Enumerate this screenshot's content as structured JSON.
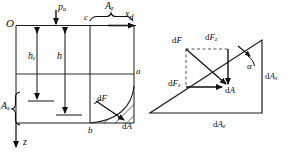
{
  "figure": {
    "type": "engineering-diagram",
    "panels": [
      "left-elevation-view",
      "right-force-decomposition"
    ]
  },
  "left_panel": {
    "axes": {
      "origin_label": "O",
      "x_axis_label": "x",
      "z_axis_label": "z"
    },
    "surface_pressure": {
      "symbol": "p",
      "subscript": "a"
    },
    "depths": [
      {
        "symbol": "h",
        "subscript": "c"
      },
      {
        "symbol": "h",
        "subscript": ""
      }
    ],
    "areas": [
      {
        "symbol": "A",
        "subscript": "z"
      },
      {
        "symbol": "A",
        "subscript": "x"
      }
    ],
    "points": [
      "c",
      "d",
      "a",
      "b"
    ],
    "force_element": {
      "symbol": "dF",
      "subscript": ""
    },
    "area_element": {
      "symbol": "dA",
      "subscript": ""
    }
  },
  "right_panel": {
    "resultant": {
      "symbol": "dF",
      "subscript": ""
    },
    "vertical_component": {
      "symbol": "dF",
      "subscript": "z"
    },
    "horizontal_component": {
      "symbol": "dF",
      "subscript": "x"
    },
    "area_element": {
      "symbol": "dA",
      "subscript": ""
    },
    "projected_areas": [
      {
        "symbol": "dA",
        "subscript": "x"
      },
      {
        "symbol": "dA",
        "subscript": "z"
      }
    ],
    "angle_label": "α"
  },
  "colors": {
    "stroke": "#1a1a1a",
    "hatch": "#2b2b2b",
    "dashed": "#555555",
    "background": "#ffffff"
  }
}
